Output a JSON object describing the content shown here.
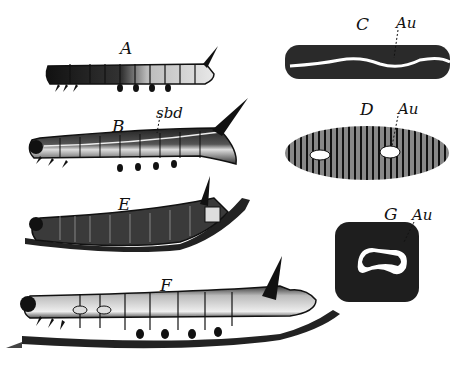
{
  "figure": {
    "panels": [
      {
        "id": "A",
        "label": "A",
        "description": "young caterpillar, dark anterior, horn at tail"
      },
      {
        "id": "B",
        "label": "B",
        "description": "caterpillar with subdorsal line",
        "annotation": "sbd"
      },
      {
        "id": "C",
        "label": "C",
        "description": "segment detail with wavy white line",
        "annotation": "Au"
      },
      {
        "id": "D",
        "label": "D",
        "description": "striped segment detail with white spots",
        "annotation": "Au"
      },
      {
        "id": "E",
        "label": "E",
        "description": "caterpillar on twig, curved"
      },
      {
        "id": "F",
        "label": "F",
        "description": "mature caterpillar on twig with large horn"
      },
      {
        "id": "G",
        "label": "G",
        "description": "single spot detail, kidney-shaped white mark",
        "annotation": "Au"
      }
    ],
    "colors": {
      "ink": "#111111",
      "paper": "#ffffff",
      "mid": "#555555",
      "light": "#d8d8d8"
    }
  }
}
